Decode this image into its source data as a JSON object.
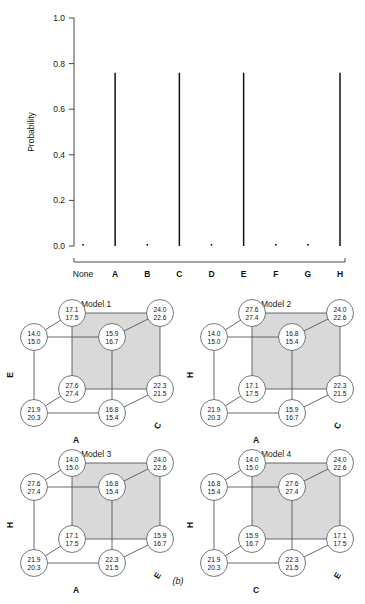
{
  "figure": {
    "panel_a_caption": "(a)",
    "panel_b_caption": "(b)"
  },
  "chart_data": {
    "type": "bar",
    "title": "",
    "subtitle": "",
    "xlabel": "",
    "ylabel": "Probability",
    "categories": [
      "None",
      "A",
      "B",
      "C",
      "D",
      "E",
      "F",
      "G",
      "H"
    ],
    "values": [
      0.005,
      0.76,
      0.005,
      0.76,
      0.005,
      0.76,
      0.005,
      0.005,
      0.76
    ],
    "ylim": [
      0.0,
      1.0
    ],
    "ytick_labels": [
      "0.0",
      "0.2",
      "0.4",
      "0.6",
      "0.8",
      "1.0"
    ],
    "ytick_values": [
      0.0,
      0.2,
      0.4,
      0.6,
      0.8,
      1.0
    ],
    "grid": false,
    "legend": "none",
    "style": "spike",
    "series_color": "#111111"
  },
  "cubes": [
    {
      "title": "Model 1",
      "axis_labels": {
        "left": "E",
        "bottom": "A",
        "right": "C"
      },
      "nodes": {
        "back_top_left": {
          "line1": "17.1",
          "line2": "17.5"
        },
        "back_top_right": {
          "line1": "24.0",
          "line2": "22.6"
        },
        "front_top_left": {
          "line1": "14.0",
          "line2": "15.0"
        },
        "front_top_right": {
          "line1": "15.9",
          "line2": "16.7"
        },
        "back_bot_left": {
          "line1": "27.6",
          "line2": "27.4"
        },
        "back_bot_right": {
          "line1": "22.3",
          "line2": "21.5"
        },
        "front_bot_left": {
          "line1": "21.9",
          "line2": "20.3"
        },
        "front_bot_right": {
          "line1": "16.8",
          "line2": "15.4"
        }
      }
    },
    {
      "title": "Model 2",
      "axis_labels": {
        "left": "H",
        "bottom": "A",
        "right": "C"
      },
      "nodes": {
        "back_top_left": {
          "line1": "27.6",
          "line2": "27.4"
        },
        "back_top_right": {
          "line1": "24.0",
          "line2": "22.6"
        },
        "front_top_left": {
          "line1": "14.0",
          "line2": "15.0"
        },
        "front_top_right": {
          "line1": "16.8",
          "line2": "15.4"
        },
        "back_bot_left": {
          "line1": "17.1",
          "line2": "17.5"
        },
        "back_bot_right": {
          "line1": "22.3",
          "line2": "21.5"
        },
        "front_bot_left": {
          "line1": "21.9",
          "line2": "20.3"
        },
        "front_bot_right": {
          "line1": "15.9",
          "line2": "16.7"
        }
      }
    },
    {
      "title": "Model 3",
      "axis_labels": {
        "left": "H",
        "bottom": "A",
        "right": "E"
      },
      "nodes": {
        "back_top_left": {
          "line1": "14.0",
          "line2": "15.0"
        },
        "back_top_right": {
          "line1": "24.0",
          "line2": "22.6"
        },
        "front_top_left": {
          "line1": "27.6",
          "line2": "27.4"
        },
        "front_top_right": {
          "line1": "16.8",
          "line2": "15.4"
        },
        "back_bot_left": {
          "line1": "17.1",
          "line2": "17.5"
        },
        "back_bot_right": {
          "line1": "15.9",
          "line2": "16.7"
        },
        "front_bot_left": {
          "line1": "21.9",
          "line2": "20.3"
        },
        "front_bot_right": {
          "line1": "22.3",
          "line2": "21.5"
        }
      }
    },
    {
      "title": "Model 4",
      "axis_labels": {
        "left": "H",
        "bottom": "C",
        "right": "E"
      },
      "nodes": {
        "back_top_left": {
          "line1": "14.0",
          "line2": "15.0"
        },
        "back_top_right": {
          "line1": "24.0",
          "line2": "22.6"
        },
        "front_top_left": {
          "line1": "16.8",
          "line2": "15.4"
        },
        "front_top_right": {
          "line1": "27.6",
          "line2": "27.4"
        },
        "back_bot_left": {
          "line1": "15.9",
          "line2": "16.7"
        },
        "back_bot_right": {
          "line1": "17.1",
          "line2": "17.5"
        },
        "front_bot_left": {
          "line1": "21.9",
          "line2": "20.3"
        },
        "front_bot_right": {
          "line1": "22.3",
          "line2": "21.5"
        }
      }
    }
  ]
}
